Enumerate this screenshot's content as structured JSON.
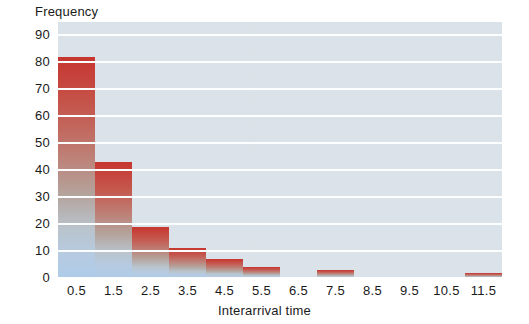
{
  "chart_data": {
    "type": "bar",
    "title": "",
    "xlabel": "Interarrival time",
    "ylabel": "Frequency",
    "categories": [
      "0.5",
      "1.5",
      "2.5",
      "3.5",
      "4.5",
      "5.5",
      "6.5",
      "7.5",
      "8.5",
      "9.5",
      "10.5",
      "11.5"
    ],
    "values": [
      82,
      43,
      19,
      11,
      7,
      4,
      0,
      3,
      0,
      0,
      0,
      2
    ],
    "ylim": [
      0,
      95
    ],
    "yticks": [
      0,
      10,
      20,
      30,
      40,
      50,
      60,
      70,
      80,
      90
    ],
    "xlim": [
      0,
      12
    ],
    "grid": "horizontal",
    "legend": "none",
    "bar_gradient_top": "#c6362f",
    "bar_gradient_bottom": "#aecbe8",
    "plot_background": "#dbe3ea",
    "gridline_color": "#fbfdfe"
  },
  "axes": {
    "y_title": "Frequency",
    "x_title": "Interarrival time",
    "y_ticks": [
      "90",
      "80",
      "70",
      "60",
      "50",
      "40",
      "30",
      "20",
      "10",
      "0"
    ],
    "x_ticks": [
      "0.5",
      "1.5",
      "2.5",
      "3.5",
      "4.5",
      "5.5",
      "6.5",
      "7.5",
      "8.5",
      "9.5",
      "10.5",
      "11.5"
    ]
  }
}
